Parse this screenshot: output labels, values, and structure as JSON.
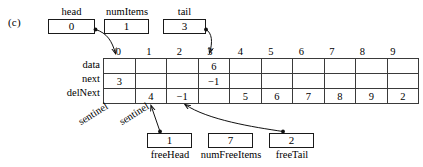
{
  "figure": {
    "label": "(c)",
    "caption_letter": "c"
  },
  "top_vars": [
    {
      "name": "head",
      "label": "head",
      "value": "0"
    },
    {
      "name": "numItems",
      "label": "numItems",
      "value": "1"
    },
    {
      "name": "tail",
      "label": "tail",
      "value": "3"
    }
  ],
  "bottom_vars": [
    {
      "name": "freeHead",
      "label": "freeHead",
      "value": "1"
    },
    {
      "name": "numFreeItems",
      "label": "numFreeItems",
      "value": "7"
    },
    {
      "name": "freeTail",
      "label": "freeTail",
      "value": "2"
    }
  ],
  "table": {
    "column_indices": [
      "0",
      "1",
      "2",
      "3",
      "4",
      "5",
      "6",
      "7",
      "8",
      "9"
    ],
    "row_labels": [
      "data",
      "next",
      "delNext"
    ],
    "rows": [
      {
        "label": "data",
        "cells": [
          "",
          "",
          "",
          "6",
          "",
          "",
          "",
          "",
          "",
          ""
        ]
      },
      {
        "label": "next",
        "cells": [
          "3",
          "",
          "",
          "−1",
          "",
          "",
          "",
          "",
          "",
          ""
        ]
      },
      {
        "label": "delNext",
        "cells": [
          "",
          "4",
          "−1",
          "",
          "5",
          "6",
          "7",
          "8",
          "9",
          "2"
        ]
      }
    ]
  },
  "annotations": {
    "sentinel_labels": [
      "sentinel",
      "sentinel"
    ]
  },
  "colors": {
    "ink": "#111111",
    "grid_line": "#3a3a3a",
    "background": "#ffffff"
  }
}
